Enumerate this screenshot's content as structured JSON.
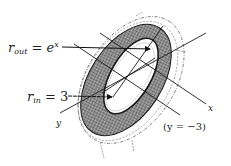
{
  "diagram": {
    "type": "annulus-washer-cross-section",
    "labels": {
      "r_out": {
        "var": "r",
        "sub": "out",
        "eq": " = ",
        "rhs": "e",
        "sup": "x"
      },
      "r_in": {
        "var": "r",
        "sub": "in",
        "eq": " = ",
        "rhs": "3"
      },
      "x_axis": "x",
      "y_axis": "y",
      "axis_line": "(y = −3)"
    },
    "colors": {
      "stroke": "#1a1a1a",
      "shade": "#8a8a8a",
      "background": "#ffffff"
    }
  }
}
